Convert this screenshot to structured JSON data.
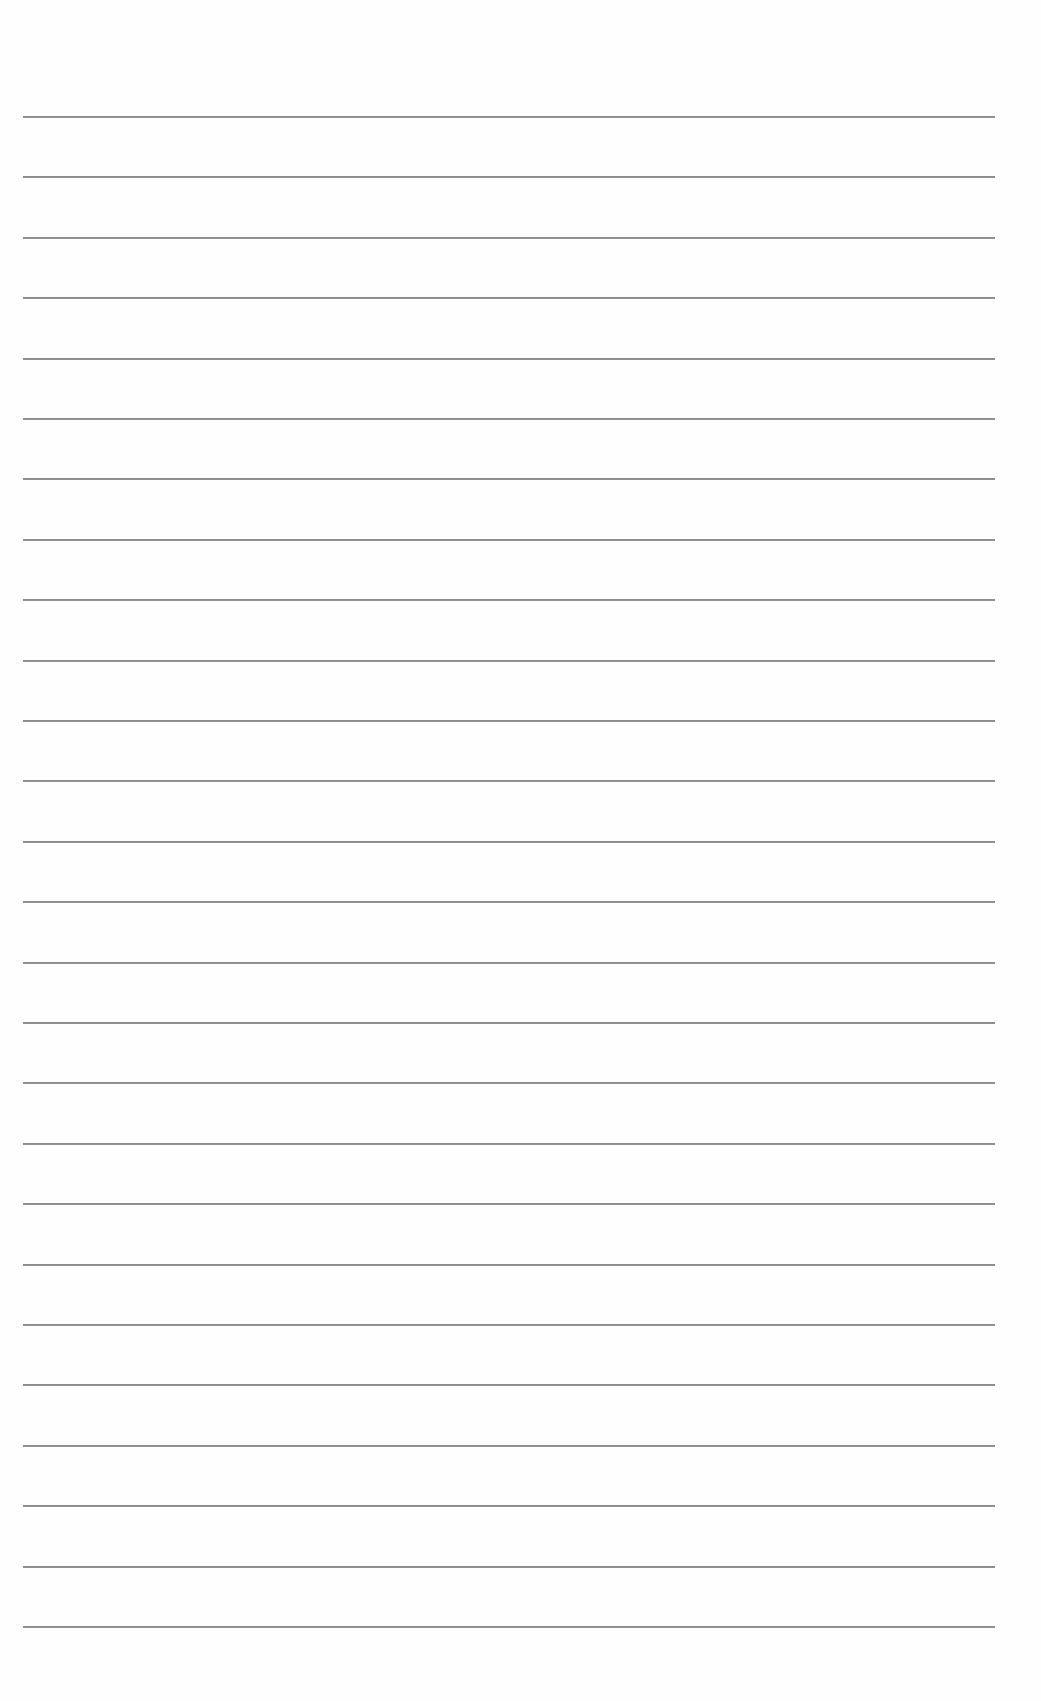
{
  "page": {
    "type": "lined-paper",
    "background_color": "#fefefe",
    "line_color": "#8c8c8c",
    "line_count": 26,
    "first_line_y": 116,
    "line_spacing": 60.4,
    "line_left_x": 23,
    "line_right_x": 995
  }
}
